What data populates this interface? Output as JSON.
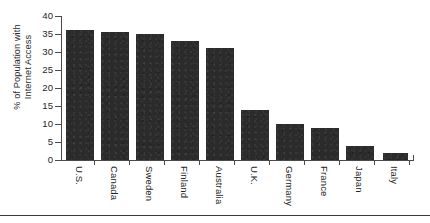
{
  "chart_data": {
    "type": "bar",
    "title": "",
    "subtitle": "",
    "xlabel": "",
    "ylabel_line1": "% of Population with",
    "ylabel_line2": "Internet Access",
    "ylabel": "% of Population with Internet Access",
    "categories": [
      "U.S.",
      "Canada",
      "Sweden",
      "Finland",
      "Australia",
      "U.K.",
      "Germany",
      "France",
      "Japan",
      "Italy"
    ],
    "values": [
      36,
      35.5,
      35,
      33,
      31,
      14,
      10,
      9,
      4,
      2
    ],
    "ylim": [
      0,
      40
    ],
    "ytick_values": [
      0,
      5,
      10,
      15,
      20,
      25,
      30,
      35,
      40
    ],
    "ytick_labels": [
      "0",
      "5",
      "10",
      "15",
      "20",
      "25",
      "30",
      "35",
      "40"
    ],
    "grid": false,
    "legend": false,
    "legend_position": "none",
    "bar_color": "#2b2b2b",
    "axis_color": "#4a4a4a",
    "background_color": "#ffffff"
  }
}
